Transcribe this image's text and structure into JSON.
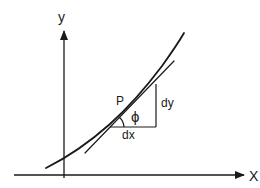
{
  "diagram": {
    "axes": {
      "x_label": "X",
      "y_label": "y"
    },
    "point_label": "P",
    "angle_label": "ϕ",
    "run_label": "dx",
    "rise_label": "dy",
    "elements": [
      "curve",
      "tangent-line",
      "right-triangle-dx-dy",
      "angle-arc-phi"
    ],
    "colors": {
      "ink": "#1a1a1a",
      "background": "#ffffff"
    }
  }
}
